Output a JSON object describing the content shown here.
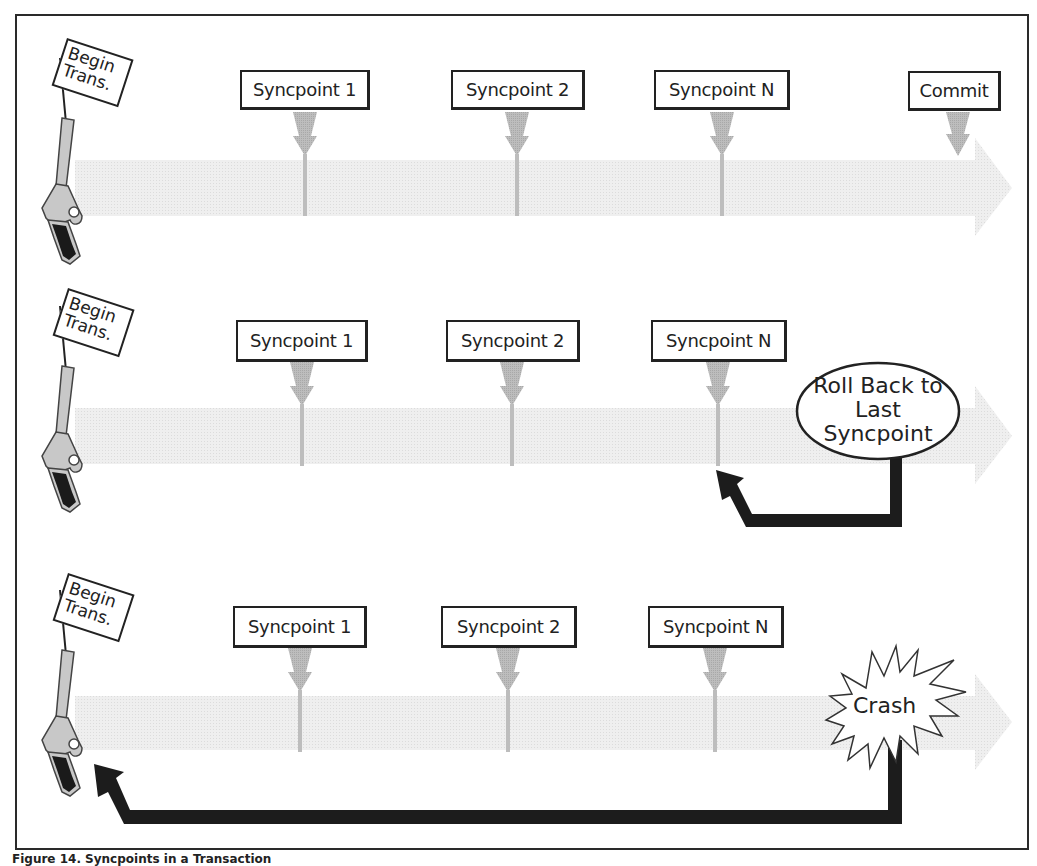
{
  "diagram": {
    "rows": [
      {
        "start_flag": "Begin Trans.",
        "start_flag_lines": [
          "Begin",
          "Trans."
        ],
        "syncpoints": [
          "Syncpoint 1",
          "Syncpoint 2",
          "Syncpoint N"
        ],
        "end_label": "Commit"
      },
      {
        "start_flag": "Begin Trans.",
        "start_flag_lines": [
          "Begin",
          "Trans."
        ],
        "syncpoints": [
          "Syncpoint 1",
          "Syncpoint 2",
          "Syncpoint N"
        ],
        "event_label": "Roll Back to Last Syncpoint",
        "event_lines": [
          "Roll Back to",
          "Last",
          "Syncpoint"
        ],
        "return_target": "Syncpoint N"
      },
      {
        "start_flag": "Begin Trans.",
        "start_flag_lines": [
          "Begin",
          "Trans."
        ],
        "syncpoints": [
          "Syncpoint 1",
          "Syncpoint 2",
          "Syncpoint N"
        ],
        "event_label": "Crash",
        "return_target": "Begin Trans."
      }
    ],
    "colors": {
      "frame": "#2a2a2a",
      "timeline_band": "#ececec",
      "marker": "#b8b8b8",
      "return_arrow": "#1c1c1c",
      "pistol_body": "#c8c8c8",
      "pistol_grip": "#1a1a1a"
    }
  },
  "caption": "Figure 14. Syncpoints in a Transaction"
}
